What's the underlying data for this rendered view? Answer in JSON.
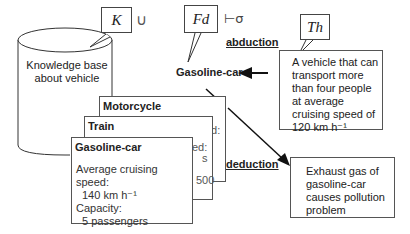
{
  "symbols": {
    "knowledge": "K",
    "union": "∪",
    "fd": "Fd",
    "entails": "⊢σ",
    "theory": "Th"
  },
  "cylinder": {
    "label_line1": "Knowledge base",
    "label_line2": "about vehicle"
  },
  "labels": {
    "abduction": "abduction",
    "deduction": "deduction",
    "gasoline_car": "Gasoline-car"
  },
  "hypothesis_box": {
    "lines": [
      "A vehicle that can",
      "transport more",
      "than four people",
      "at average",
      "cruising speed of",
      "120 km h⁻¹"
    ]
  },
  "conclusion_box": {
    "lines": [
      "Exhaust gas of",
      "gasoline-car",
      "causes pollution",
      "problem"
    ]
  },
  "cards": {
    "motorcycle": {
      "title": "Motorcycle",
      "peek1": "ed:"
    },
    "train": {
      "title": "Train",
      "peek1": "ed:",
      "peek2": "s",
      "peek3": "500"
    },
    "gasoline_car": {
      "title": "Gasoline-car",
      "speed_label": "Average cruising speed:",
      "speed_value": "140 km h⁻¹",
      "capacity_label": "Capacity:",
      "capacity_value": "5 passengers"
    }
  }
}
